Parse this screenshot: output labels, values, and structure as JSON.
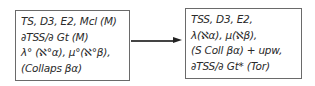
{
  "diagram": {
    "type": "flow",
    "nodes": [
      {
        "id": "left",
        "lines": [
          "TS, D3, E2, Mcl (M)",
          "∂TSS/∂ Gt (M)",
          "λ° (ℵ°α), μ°(ℵ°β),",
          "(Collaps βα)"
        ]
      },
      {
        "id": "right",
        "lines": [
          "TSS, D3, E2,",
          "λ(ℵα), μ(ℵβ),",
          "(S Coll βα) + upw,",
          "∂TSS/∂ Gt* (Tor)"
        ]
      }
    ],
    "edges": [
      {
        "from": "left",
        "to": "right",
        "style": "arrow"
      }
    ],
    "colors": {
      "border": "#6a6a6a",
      "text": "#2a2a2a",
      "arrow": "#333333"
    }
  }
}
